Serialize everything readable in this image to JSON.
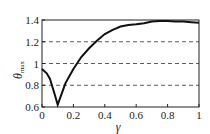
{
  "chart_data": {
    "type": "line",
    "title": "",
    "xlabel": "γ",
    "ylabel": "θmax",
    "ylabel_main": "θ",
    "ylabel_sub": "max",
    "xlim": [
      0,
      1
    ],
    "ylim": [
      0.6,
      1.4
    ],
    "x_ticks": [
      "0",
      "0.2",
      "0.4",
      "0.6",
      "0.8",
      "1"
    ],
    "y_ticks": [
      "0.6",
      "0.8",
      "1",
      "1.2",
      "1.4"
    ],
    "grid": "dashed horizontal at 0.8, 1.0, 1.2",
    "series": [
      {
        "name": "θmax",
        "x": [
          0,
          0.03,
          0.05,
          0.08,
          0.1,
          0.12,
          0.15,
          0.2,
          0.25,
          0.3,
          0.35,
          0.4,
          0.45,
          0.5,
          0.55,
          0.6,
          0.65,
          0.7,
          0.75,
          0.8,
          0.85,
          0.9,
          0.95,
          1.0
        ],
        "values": [
          0.95,
          0.91,
          0.86,
          0.72,
          0.62,
          0.7,
          0.82,
          0.95,
          1.06,
          1.14,
          1.21,
          1.27,
          1.31,
          1.34,
          1.355,
          1.36,
          1.37,
          1.385,
          1.39,
          1.39,
          1.385,
          1.385,
          1.38,
          1.375
        ]
      }
    ]
  }
}
